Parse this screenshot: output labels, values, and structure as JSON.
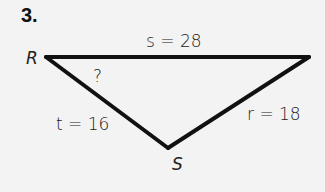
{
  "problem": {
    "number": "3.",
    "vertices": {
      "R": "R",
      "S": "S"
    },
    "sides": {
      "s": "s = 28",
      "t": "t = 16",
      "r": "r = 18"
    },
    "unknown_angle": "?"
  }
}
